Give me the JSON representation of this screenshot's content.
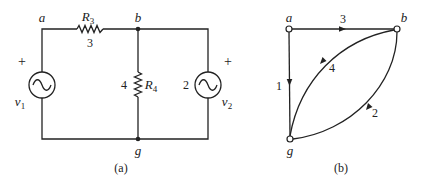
{
  "figure": {
    "panel_a": {
      "caption": "(a)",
      "nodes": {
        "a": "a",
        "b": "b",
        "g": "g"
      },
      "resistors": [
        {
          "name": "R",
          "sub": "3",
          "value": "3"
        },
        {
          "name": "R",
          "sub": "4",
          "value": "4"
        }
      ],
      "sources": [
        {
          "name": "v",
          "sub": "1",
          "polarity": "+"
        },
        {
          "name": "v",
          "sub": "2",
          "polarity": "+",
          "branch": "2"
        }
      ]
    },
    "panel_b": {
      "caption": "(b)",
      "nodes": {
        "a": "a",
        "b": "b",
        "g": "g"
      },
      "edges": [
        {
          "label": "3",
          "from": "a",
          "to": "b"
        },
        {
          "label": "1",
          "from": "a",
          "to": "g"
        },
        {
          "label": "4",
          "from": "b",
          "to": "g"
        },
        {
          "label": "2",
          "from": "b",
          "to": "g"
        }
      ]
    },
    "colors": {
      "ink": "#222222",
      "background": "#ffffff"
    }
  }
}
